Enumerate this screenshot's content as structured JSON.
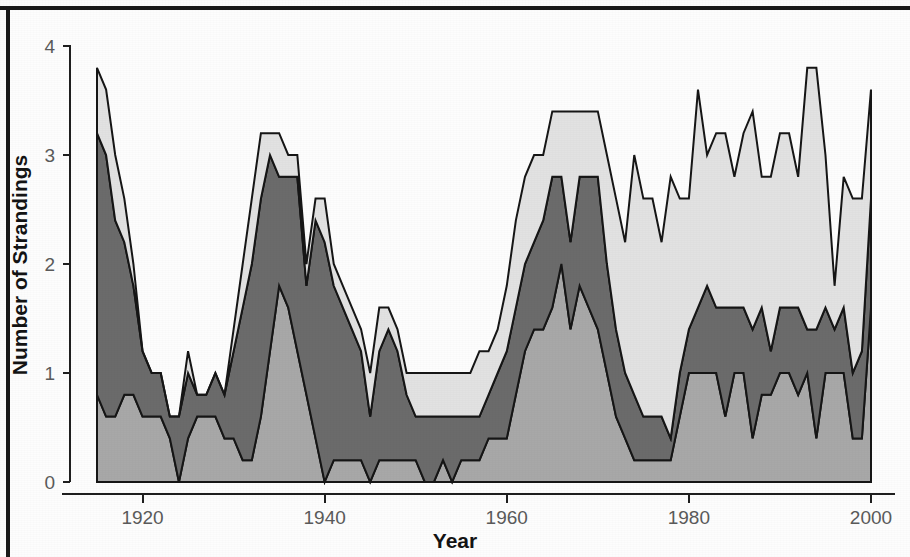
{
  "chart_data": {
    "type": "area",
    "title": "",
    "subtitle": "",
    "xlabel": "Year",
    "ylabel": "Number of Strandings",
    "stacked": true,
    "grid": false,
    "legend": "none",
    "xlim": [
      1915,
      2000
    ],
    "ylim": [
      0,
      4.2
    ],
    "xticks": [
      1920,
      1940,
      1960,
      1980,
      2000
    ],
    "xtick_labels": [
      "1920",
      "1940",
      "1960",
      "1980",
      "2000"
    ],
    "yticks": [
      0,
      1,
      2,
      3,
      4
    ],
    "ytick_labels": [
      "0",
      "1",
      "2",
      "3",
      "4"
    ],
    "colors": {
      "bottom": "#a8a8a8",
      "middle": "#6b6b6b",
      "top": "#e2e2e2",
      "outline": "#161616",
      "axis": "#1f1f1f",
      "tick_text": "#5a5a5a",
      "axis_title": "#141414",
      "frame": "#1a1a1a",
      "background": "#fdfdfd"
    },
    "x": [
      1915,
      1916,
      1917,
      1918,
      1919,
      1920,
      1921,
      1922,
      1923,
      1924,
      1925,
      1926,
      1927,
      1928,
      1929,
      1930,
      1931,
      1932,
      1933,
      1934,
      1935,
      1936,
      1937,
      1938,
      1939,
      1940,
      1941,
      1942,
      1943,
      1944,
      1945,
      1946,
      1947,
      1948,
      1949,
      1950,
      1951,
      1952,
      1953,
      1954,
      1955,
      1956,
      1957,
      1958,
      1959,
      1960,
      1961,
      1962,
      1963,
      1964,
      1965,
      1966,
      1967,
      1968,
      1969,
      1970,
      1971,
      1972,
      1973,
      1974,
      1975,
      1976,
      1977,
      1978,
      1979,
      1980,
      1981,
      1982,
      1983,
      1984,
      1985,
      1986,
      1987,
      1988,
      1989,
      1990,
      1991,
      1992,
      1993,
      1994,
      1995,
      1996,
      1997,
      1998,
      1999,
      2000
    ],
    "series": [
      {
        "name": "bottom-layer",
        "color": "#a8a8a8",
        "values": [
          0.8,
          0.6,
          0.6,
          0.8,
          0.8,
          0.6,
          0.6,
          0.6,
          0.4,
          0.0,
          0.4,
          0.6,
          0.6,
          0.6,
          0.4,
          0.4,
          0.2,
          0.2,
          0.6,
          1.2,
          1.8,
          1.6,
          1.2,
          0.8,
          0.4,
          0.0,
          0.2,
          0.2,
          0.2,
          0.2,
          0.0,
          0.2,
          0.2,
          0.2,
          0.2,
          0.2,
          0.0,
          0.0,
          0.2,
          0.0,
          0.2,
          0.2,
          0.2,
          0.4,
          0.4,
          0.4,
          0.8,
          1.2,
          1.4,
          1.4,
          1.6,
          2.0,
          1.4,
          1.8,
          1.6,
          1.4,
          1.0,
          0.6,
          0.4,
          0.2,
          0.2,
          0.2,
          0.2,
          0.2,
          0.6,
          1.0,
          1.0,
          1.0,
          1.0,
          0.6,
          1.0,
          1.0,
          0.4,
          0.8,
          0.8,
          1.0,
          1.0,
          0.8,
          1.0,
          0.4,
          1.0,
          1.0,
          1.0,
          0.4,
          0.4,
          1.6
        ]
      },
      {
        "name": "middle-layer",
        "color": "#6b6b6b",
        "values": [
          2.4,
          2.4,
          1.8,
          1.4,
          1.0,
          0.6,
          0.4,
          0.4,
          0.2,
          0.6,
          0.6,
          0.2,
          0.2,
          0.4,
          0.4,
          0.8,
          1.4,
          1.8,
          2.0,
          1.8,
          1.0,
          1.2,
          1.6,
          1.0,
          2.0,
          2.2,
          1.6,
          1.4,
          1.2,
          1.0,
          0.6,
          1.0,
          1.2,
          1.0,
          0.6,
          0.4,
          0.6,
          0.6,
          0.4,
          0.6,
          0.4,
          0.4,
          0.4,
          0.4,
          0.6,
          0.8,
          0.8,
          0.8,
          0.8,
          1.0,
          1.2,
          0.8,
          0.8,
          1.0,
          1.2,
          1.4,
          1.0,
          0.8,
          0.6,
          0.6,
          0.4,
          0.4,
          0.4,
          0.2,
          0.4,
          0.4,
          0.6,
          0.8,
          0.6,
          1.0,
          0.6,
          0.6,
          1.0,
          0.8,
          0.4,
          0.6,
          0.6,
          0.8,
          0.4,
          1.0,
          0.6,
          0.4,
          0.6,
          0.6,
          0.8,
          1.0
        ]
      },
      {
        "name": "top-layer",
        "color": "#e2e2e2",
        "values": [
          0.6,
          0.6,
          0.6,
          0.4,
          0.2,
          0.0,
          0.0,
          0.0,
          0.0,
          0.0,
          0.2,
          0.0,
          0.0,
          0.0,
          0.0,
          0.2,
          0.4,
          0.6,
          0.6,
          0.2,
          0.4,
          0.2,
          0.2,
          0.2,
          0.2,
          0.4,
          0.2,
          0.2,
          0.2,
          0.2,
          0.4,
          0.4,
          0.2,
          0.2,
          0.2,
          0.4,
          0.4,
          0.4,
          0.4,
          0.4,
          0.4,
          0.4,
          0.6,
          0.4,
          0.4,
          0.6,
          0.8,
          0.8,
          0.8,
          0.6,
          0.6,
          0.6,
          1.2,
          0.6,
          0.6,
          0.6,
          1.0,
          1.2,
          1.2,
          2.2,
          2.0,
          2.0,
          1.6,
          2.4,
          1.6,
          1.2,
          2.0,
          1.2,
          1.6,
          1.6,
          1.2,
          1.6,
          2.0,
          1.2,
          1.6,
          1.6,
          1.6,
          1.2,
          2.4,
          2.4,
          1.4,
          0.4,
          1.2,
          1.6,
          1.4,
          1.0
        ]
      }
    ]
  }
}
